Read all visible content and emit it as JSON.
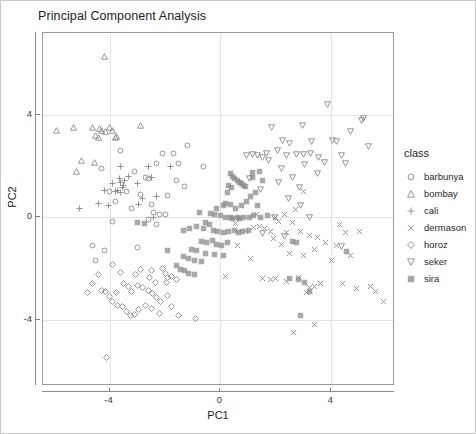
{
  "title": "Principal Component Analysis",
  "legend": {
    "title": "class",
    "items": [
      {
        "label": "barbunya",
        "marker": "circle-open-icon"
      },
      {
        "label": "bombay",
        "marker": "triangle-up-open-icon"
      },
      {
        "label": "cali",
        "marker": "plus-icon"
      },
      {
        "label": "dermason",
        "marker": "cross-x-icon"
      },
      {
        "label": "horoz",
        "marker": "diamond-open-icon"
      },
      {
        "label": "seker",
        "marker": "triangle-down-open-icon"
      },
      {
        "label": "sira",
        "marker": "square-filled-icon"
      }
    ]
  },
  "axes": {
    "x_title": "PC1",
    "y_title": "PC2",
    "x_ticks": [
      "-4",
      "0",
      "4"
    ],
    "y_ticks": [
      "4",
      "0",
      "-4"
    ]
  },
  "chart_data": {
    "type": "scatter",
    "title": "Principal Component Analysis",
    "xlabel": "PC1",
    "ylabel": "PC2",
    "xlim": [
      -6.4,
      6.3
    ],
    "ylim": [
      -6.6,
      7.2
    ],
    "xticks": [
      -4,
      0,
      4
    ],
    "yticks": [
      -4,
      0,
      4
    ],
    "grid": true,
    "legend_title": "class",
    "legend_position": "right",
    "marker_color": "#8a8a8a",
    "series": [
      {
        "name": "barbunya",
        "marker": "circle-open",
        "points": [
          [
            -3.6,
            2.6
          ],
          [
            -2.1,
            2.5
          ],
          [
            -1.7,
            2.5
          ],
          [
            -1.2,
            2.8
          ],
          [
            -2.3,
            2.1
          ],
          [
            -1.5,
            2.1
          ],
          [
            -0.6,
            2.0
          ],
          [
            -4.3,
            1.9
          ],
          [
            -3.1,
            1.8
          ],
          [
            -2.6,
            1.5
          ],
          [
            -1.3,
            1.2
          ],
          [
            -4.0,
            1.0
          ],
          [
            -3.4,
            1.0
          ],
          [
            -2.9,
            0.9
          ],
          [
            -3.8,
            0.6
          ],
          [
            -2.5,
            0.5
          ],
          [
            -2.4,
            0.2
          ],
          [
            -2.2,
            0.1
          ],
          [
            -2.0,
            0.1
          ],
          [
            -2.6,
            -0.1
          ],
          [
            -3.9,
            -0.15
          ],
          [
            -2.3,
            -0.3
          ],
          [
            -4.6,
            -1.1
          ],
          [
            -4.2,
            -1.3
          ],
          [
            -3.0,
            -1.2
          ],
          [
            -4.5,
            -1.7
          ],
          [
            -1.9,
            0.85
          ],
          [
            -3.2,
            0.35
          ],
          [
            -2.7,
            1.55
          ],
          [
            -1.6,
            1.45
          ]
        ]
      },
      {
        "name": "bombay",
        "marker": "triangle-up-open",
        "points": [
          [
            -4.2,
            6.3
          ],
          [
            -5.9,
            3.4
          ],
          [
            -5.3,
            3.5
          ],
          [
            -4.6,
            3.5
          ],
          [
            -4.3,
            3.4
          ],
          [
            -4.0,
            3.5
          ],
          [
            -3.9,
            3.4
          ],
          [
            -4.4,
            3.1
          ],
          [
            -3.8,
            3.1
          ],
          [
            -2.9,
            3.6
          ],
          [
            -5.0,
            2.2
          ],
          [
            -5.2,
            1.8
          ],
          [
            -4.35,
            3.45
          ],
          [
            -4.15,
            3.35
          ],
          [
            -3.75,
            3.15
          ],
          [
            -4.5,
            3.2
          ],
          [
            -4.55,
            2.15
          ]
        ]
      },
      {
        "name": "cali",
        "marker": "plus",
        "points": [
          [
            -3.6,
            2.0
          ],
          [
            -2.6,
            2.0
          ],
          [
            -1.8,
            2.0
          ],
          [
            -3.3,
            1.6
          ],
          [
            -2.5,
            1.55
          ],
          [
            -3.9,
            1.3
          ],
          [
            -3.6,
            1.35
          ],
          [
            -3.5,
            1.25
          ],
          [
            -3.0,
            1.3
          ],
          [
            -4.2,
            1.05
          ],
          [
            -3.8,
            1.0
          ],
          [
            -3.7,
            1.05
          ],
          [
            -3.6,
            0.95
          ],
          [
            -2.8,
            0.75
          ],
          [
            -5.1,
            0.35
          ],
          [
            -4.4,
            0.55
          ],
          [
            -2.3,
            0.8
          ],
          [
            -2.4,
            0.0
          ],
          [
            -3.55,
            1.15
          ],
          [
            -3.45,
            1.45
          ],
          [
            -3.65,
            1.5
          ],
          [
            -4.05,
            0.45
          ],
          [
            -2.95,
            0.5
          ]
        ]
      },
      {
        "name": "dermason",
        "marker": "cross-x",
        "points": [
          [
            3.0,
            1.0
          ],
          [
            2.7,
            0.3
          ],
          [
            2.3,
            0.1
          ],
          [
            2.0,
            0.0
          ],
          [
            2.1,
            -0.15
          ],
          [
            1.6,
            -0.45
          ],
          [
            1.8,
            -0.55
          ],
          [
            2.4,
            -0.6
          ],
          [
            2.9,
            -0.55
          ],
          [
            3.2,
            -0.7
          ],
          [
            3.5,
            -0.8
          ],
          [
            3.8,
            -1.0
          ],
          [
            4.2,
            -1.1
          ],
          [
            4.5,
            -0.6
          ],
          [
            5.0,
            -0.55
          ],
          [
            1.2,
            -0.4
          ],
          [
            1.4,
            -0.35
          ],
          [
            0.9,
            -0.55
          ],
          [
            0.6,
            -1.1
          ],
          [
            1.1,
            -1.6
          ],
          [
            2.5,
            -1.4
          ],
          [
            3.0,
            -1.5
          ],
          [
            3.4,
            -1.25
          ],
          [
            4.0,
            -1.7
          ],
          [
            4.7,
            -1.5
          ],
          [
            1.5,
            -2.4
          ],
          [
            1.8,
            -2.45
          ],
          [
            2.0,
            -2.4
          ],
          [
            2.4,
            -2.5
          ],
          [
            2.8,
            -2.35
          ],
          [
            3.2,
            -2.75
          ],
          [
            3.4,
            -2.7
          ],
          [
            3.6,
            -2.6
          ],
          [
            3.1,
            -2.95
          ],
          [
            4.4,
            -2.6
          ],
          [
            4.9,
            -2.8
          ],
          [
            5.4,
            -2.7
          ],
          [
            5.6,
            -2.9
          ],
          [
            5.9,
            -3.3
          ],
          [
            3.4,
            -4.2
          ],
          [
            2.65,
            -4.5
          ],
          [
            0.2,
            -2.3
          ],
          [
            2.6,
            -0.2
          ],
          [
            2.2,
            -1.05
          ],
          [
            1.9,
            -0.85
          ],
          [
            4.3,
            -0.3
          ],
          [
            1.3,
            0.1
          ],
          [
            0.55,
            -0.25
          ]
        ]
      },
      {
        "name": "horoz",
        "marker": "diamond-open",
        "points": [
          [
            -4.1,
            -5.5
          ],
          [
            -3.9,
            -1.85
          ],
          [
            -4.4,
            -2.25
          ],
          [
            -3.6,
            -2.15
          ],
          [
            -2.9,
            -2.05
          ],
          [
            -2.5,
            -2.1
          ],
          [
            -2.1,
            -2.0
          ],
          [
            -2.0,
            -2.2
          ],
          [
            -1.9,
            -2.35
          ],
          [
            -1.75,
            -2.3
          ],
          [
            -1.6,
            -2.45
          ],
          [
            -4.6,
            -2.6
          ],
          [
            -4.3,
            -2.85
          ],
          [
            -4.15,
            -2.9
          ],
          [
            -4.0,
            -3.1
          ],
          [
            -3.5,
            -2.6
          ],
          [
            -3.3,
            -2.7
          ],
          [
            -3.2,
            -2.9
          ],
          [
            -3.0,
            -2.65
          ],
          [
            -2.8,
            -2.75
          ],
          [
            -2.6,
            -2.85
          ],
          [
            -2.45,
            -3.0
          ],
          [
            -2.3,
            -3.15
          ],
          [
            -2.15,
            -3.3
          ],
          [
            -3.9,
            -3.3
          ],
          [
            -3.7,
            -3.45
          ],
          [
            -3.55,
            -3.5
          ],
          [
            -3.4,
            -3.7
          ],
          [
            -3.25,
            -3.85
          ],
          [
            -3.1,
            -3.8
          ],
          [
            -2.95,
            -3.6
          ],
          [
            -2.7,
            -3.45
          ],
          [
            -2.5,
            -3.55
          ],
          [
            -2.2,
            -3.75
          ],
          [
            -1.9,
            -3.05
          ],
          [
            -1.75,
            -3.5
          ],
          [
            -1.5,
            -3.85
          ],
          [
            -0.9,
            -3.95
          ],
          [
            -4.8,
            -2.95
          ],
          [
            -2.35,
            -2.55
          ],
          [
            -2.55,
            -2.35
          ],
          [
            -1.95,
            -2.55
          ],
          [
            -3.05,
            -2.25
          ],
          [
            -3.75,
            -2.95
          ]
        ]
      },
      {
        "name": "seker",
        "marker": "triangle-down-open",
        "points": [
          [
            3.85,
            4.4
          ],
          [
            1.85,
            3.5
          ],
          [
            2.95,
            3.6
          ],
          [
            5.1,
            3.8
          ],
          [
            5.15,
            3.85
          ],
          [
            4.7,
            3.35
          ],
          [
            2.25,
            3.0
          ],
          [
            2.5,
            2.9
          ],
          [
            3.3,
            2.95
          ],
          [
            4.05,
            3.0
          ],
          [
            4.2,
            2.95
          ],
          [
            5.35,
            2.75
          ],
          [
            1.35,
            2.4
          ],
          [
            1.5,
            2.35
          ],
          [
            1.65,
            2.5
          ],
          [
            2.05,
            2.6
          ],
          [
            2.4,
            2.4
          ],
          [
            2.75,
            2.45
          ],
          [
            3.0,
            2.45
          ],
          [
            3.25,
            2.5
          ],
          [
            3.55,
            2.35
          ],
          [
            4.35,
            2.4
          ],
          [
            4.5,
            2.1
          ],
          [
            1.15,
            2.45
          ],
          [
            0.95,
            2.4
          ],
          [
            1.75,
            2.2
          ],
          [
            2.2,
            1.9
          ],
          [
            3.5,
            1.7
          ],
          [
            2.6,
            1.55
          ],
          [
            2.1,
            1.35
          ],
          [
            2.85,
            1.15
          ],
          [
            1.45,
            1.1
          ],
          [
            2.45,
            0.75
          ],
          [
            2.9,
            0.45
          ],
          [
            1.95,
            0.0
          ],
          [
            1.5,
            -0.65
          ],
          [
            2.3,
            -0.75
          ],
          [
            3.2,
            0.0
          ],
          [
            4.35,
            -1.15
          ],
          [
            1.05,
            1.5
          ],
          [
            3.05,
            2.05
          ],
          [
            3.75,
            2.15
          ]
        ]
      },
      {
        "name": "sira",
        "marker": "square-filled",
        "points": [
          [
            0.35,
            1.7
          ],
          [
            0.45,
            1.6
          ],
          [
            0.5,
            1.5
          ],
          [
            0.6,
            1.45
          ],
          [
            0.7,
            1.35
          ],
          [
            0.75,
            1.3
          ],
          [
            0.85,
            1.25
          ],
          [
            0.9,
            1.2
          ],
          [
            0.3,
            1.25
          ],
          [
            0.4,
            1.15
          ],
          [
            1.15,
            1.75
          ],
          [
            1.4,
            1.8
          ],
          [
            0.2,
            0.55
          ],
          [
            0.35,
            0.5
          ],
          [
            0.1,
            0.45
          ],
          [
            -0.15,
            0.35
          ],
          [
            0.55,
            0.35
          ],
          [
            0.75,
            0.45
          ],
          [
            0.95,
            0.6
          ],
          [
            1.1,
            0.8
          ],
          [
            1.25,
            0.95
          ],
          [
            -0.35,
            0.15
          ],
          [
            -0.2,
            0.1
          ],
          [
            0.0,
            0.05
          ],
          [
            0.2,
            0.0
          ],
          [
            0.35,
            0.0
          ],
          [
            0.45,
            -0.05
          ],
          [
            0.6,
            0.0
          ],
          [
            0.7,
            -0.05
          ],
          [
            0.85,
            0.0
          ],
          [
            1.05,
            0.0
          ],
          [
            1.2,
            0.05
          ],
          [
            1.45,
            0.0
          ],
          [
            1.7,
            0.05
          ],
          [
            -0.55,
            -0.2
          ],
          [
            -0.4,
            -0.3
          ],
          [
            -0.6,
            -0.45
          ],
          [
            -0.85,
            -0.35
          ],
          [
            -1.1,
            -0.45
          ],
          [
            -1.35,
            -0.5
          ],
          [
            -0.25,
            -0.5
          ],
          [
            -0.1,
            -0.55
          ],
          [
            0.1,
            -0.6
          ],
          [
            0.3,
            -0.55
          ],
          [
            0.5,
            -0.5
          ],
          [
            0.65,
            -0.6
          ],
          [
            0.8,
            -0.55
          ],
          [
            1.0,
            -0.5
          ],
          [
            -0.7,
            -0.95
          ],
          [
            -0.5,
            -1.0
          ],
          [
            -0.3,
            -0.9
          ],
          [
            -0.15,
            -1.05
          ],
          [
            0.05,
            -1.1
          ],
          [
            0.25,
            -1.0
          ],
          [
            -1.05,
            -1.25
          ],
          [
            -0.85,
            -1.3
          ],
          [
            -0.55,
            -1.4
          ],
          [
            -0.2,
            -1.45
          ],
          [
            0.1,
            -1.5
          ],
          [
            -1.35,
            -1.55
          ],
          [
            -1.15,
            -1.6
          ],
          [
            -0.95,
            -1.7
          ],
          [
            -0.7,
            -1.75
          ],
          [
            -1.6,
            -1.9
          ],
          [
            -1.45,
            -2.05
          ],
          [
            -1.3,
            -2.1
          ],
          [
            -1.15,
            -2.2
          ],
          [
            -0.95,
            -2.25
          ],
          [
            -2.75,
            -0.25
          ],
          [
            -3.0,
            -0.2
          ],
          [
            2.6,
            -0.95
          ],
          [
            2.75,
            -1.0
          ],
          [
            2.5,
            -2.4
          ],
          [
            2.8,
            -2.45
          ],
          [
            3.05,
            -2.55
          ],
          [
            3.2,
            -2.9
          ],
          [
            4.55,
            -1.35
          ],
          [
            2.9,
            -3.85
          ],
          [
            1.15,
            1.55
          ],
          [
            0.25,
            0.95
          ],
          [
            -0.75,
            0.2
          ],
          [
            1.5,
            1.45
          ],
          [
            1.35,
            0.45
          ],
          [
            -1.9,
            -1.3
          ]
        ]
      }
    ]
  }
}
